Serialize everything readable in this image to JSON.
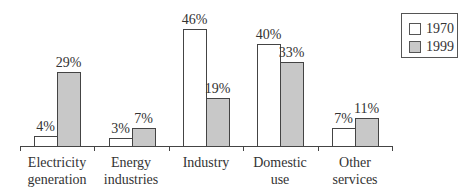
{
  "chart_data": {
    "type": "bar",
    "title": "",
    "xlabel": "",
    "ylabel": "",
    "ylim": [
      0,
      50
    ],
    "grid": false,
    "legend_position": "top-right",
    "categories": [
      "Electricity generation",
      "Energy industries",
      "Industry",
      "Domestic use",
      "Other services"
    ],
    "category_lines": [
      [
        "Electricity",
        "generation"
      ],
      [
        "Energy",
        "industries"
      ],
      [
        "Industry",
        ""
      ],
      [
        "Domestic",
        "use"
      ],
      [
        "Other",
        "services"
      ]
    ],
    "series": [
      {
        "name": "1970",
        "color": "#ffffff",
        "values": [
          4,
          3,
          46,
          40,
          7
        ],
        "labels": [
          "4%",
          "3%",
          "46%",
          "40%",
          "7%"
        ]
      },
      {
        "name": "1999",
        "color": "#c8c8c8",
        "values": [
          29,
          7,
          19,
          33,
          11
        ],
        "labels": [
          "29%",
          "7%",
          "19%",
          "33%",
          "11%"
        ]
      }
    ]
  },
  "legend": {
    "items": [
      {
        "label": "1970",
        "color": "#ffffff"
      },
      {
        "label": "1999",
        "color": "#c8c8c8"
      }
    ]
  }
}
